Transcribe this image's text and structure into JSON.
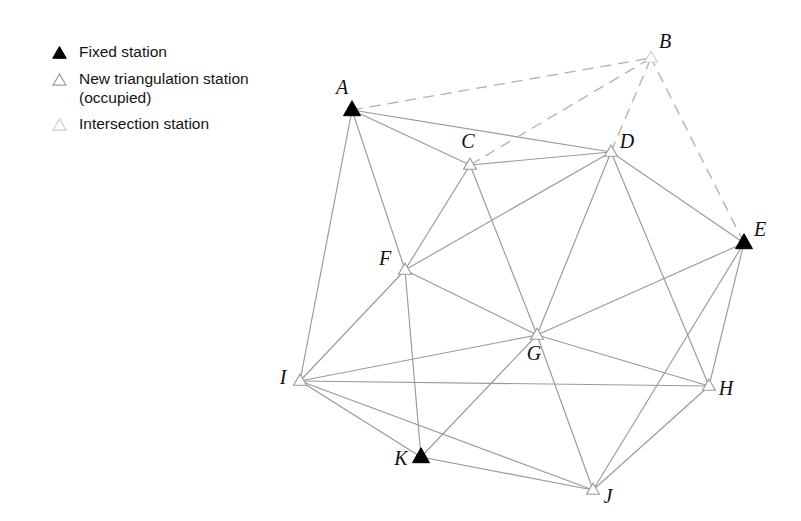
{
  "figure": {
    "width": 801,
    "height": 521,
    "background": "#ffffff"
  },
  "legend": {
    "items": [
      {
        "symbol": "filled-triangle-icon",
        "label": "Fixed station",
        "fill": "#000000",
        "stroke": "#000000"
      },
      {
        "symbol": "open-triangle-icon",
        "label": "New triangulation station\n(occupied)",
        "fill": "#ffffff",
        "stroke": "#9a9a9a"
      },
      {
        "symbol": "light-open-triangle-icon",
        "label": "Intersection station",
        "fill": "#ffffff",
        "stroke": "#cfcfcf"
      }
    ]
  },
  "chart_data": {
    "type": "diagram",
    "subtype": "triangulation-network-graph",
    "colors": {
      "solid_edge": "#9a9a9a",
      "dashed_edge": "#b5b5b5",
      "fixed_station_fill": "#000000",
      "new_station_stroke": "#9a9a9a",
      "intersection_station_stroke": "#cfcfcf",
      "label_color": "#111111"
    },
    "node_types": {
      "fixed": "Fixed station",
      "new": "New triangulation station (occupied)",
      "intersection": "Intersection station"
    },
    "nodes": [
      {
        "id": "A",
        "label": "A",
        "x": 352,
        "y": 110,
        "type": "fixed",
        "label_dx": -10,
        "label_dy": -16
      },
      {
        "id": "B",
        "label": "B",
        "x": 651,
        "y": 58,
        "type": "intersection",
        "label_dx": 14,
        "label_dy": -10
      },
      {
        "id": "C",
        "label": "C",
        "x": 470,
        "y": 165,
        "type": "new",
        "label_dx": -2,
        "label_dy": -17
      },
      {
        "id": "D",
        "label": "D",
        "x": 611,
        "y": 152,
        "type": "new",
        "label_dx": 16,
        "label_dy": -4
      },
      {
        "id": "E",
        "label": "E",
        "x": 744,
        "y": 243,
        "type": "fixed",
        "label_dx": 16,
        "label_dy": -7
      },
      {
        "id": "F",
        "label": "F",
        "x": 405,
        "y": 270,
        "type": "new",
        "label_dx": -20,
        "label_dy": -5
      },
      {
        "id": "G",
        "label": "G",
        "x": 537,
        "y": 335,
        "type": "new",
        "label_dx": -3,
        "label_dy": 25
      },
      {
        "id": "H",
        "label": "H",
        "x": 709,
        "y": 386,
        "type": "new",
        "label_dx": 17,
        "label_dy": 9
      },
      {
        "id": "I",
        "label": "I",
        "x": 300,
        "y": 381,
        "type": "new",
        "label_dx": -17,
        "label_dy": 3
      },
      {
        "id": "J",
        "label": "J",
        "x": 593,
        "y": 490,
        "type": "new",
        "label_dx": 15,
        "label_dy": 13
      },
      {
        "id": "K",
        "label": "K",
        "x": 421,
        "y": 457,
        "type": "fixed",
        "label_dx": -20,
        "label_dy": 8
      }
    ],
    "edges_solid": [
      [
        "A",
        "C"
      ],
      [
        "A",
        "D"
      ],
      [
        "A",
        "F"
      ],
      [
        "A",
        "I"
      ],
      [
        "C",
        "D"
      ],
      [
        "C",
        "F"
      ],
      [
        "C",
        "G"
      ],
      [
        "D",
        "E"
      ],
      [
        "D",
        "F"
      ],
      [
        "D",
        "G"
      ],
      [
        "D",
        "H"
      ],
      [
        "E",
        "G"
      ],
      [
        "E",
        "H"
      ],
      [
        "E",
        "J"
      ],
      [
        "F",
        "G"
      ],
      [
        "F",
        "I"
      ],
      [
        "F",
        "K"
      ],
      [
        "G",
        "H"
      ],
      [
        "G",
        "I"
      ],
      [
        "G",
        "J"
      ],
      [
        "G",
        "K"
      ],
      [
        "H",
        "I"
      ],
      [
        "H",
        "J"
      ],
      [
        "I",
        "J"
      ],
      [
        "I",
        "K"
      ],
      [
        "J",
        "K"
      ]
    ],
    "edges_dashed": [
      [
        "A",
        "B"
      ],
      [
        "C",
        "B"
      ],
      [
        "D",
        "B"
      ],
      [
        "E",
        "B"
      ]
    ]
  }
}
